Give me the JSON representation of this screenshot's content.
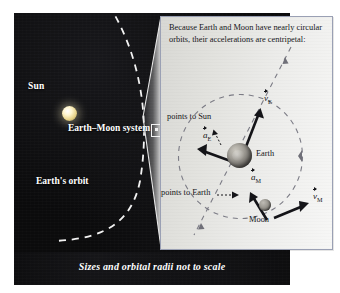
{
  "figure": {
    "caption": "Sizes and orbital radii not to scale"
  },
  "space_scene": {
    "sun_label": "Sun",
    "earth_moon_system_label": "Earth–Moon system",
    "earth_orbit_label": "Earth's orbit"
  },
  "inset": {
    "explanation": "Because Earth and Moon have nearly circular orbits, their accelerations are centripetal:",
    "earth_label": "Earth",
    "moon_label": "Moon",
    "points_to_sun_label": "points to Sun",
    "points_to_earth_label": "points to Earth",
    "vectors": {
      "v_earth": {
        "symbol": "v",
        "subscript": "E"
      },
      "a_earth": {
        "symbol": "a",
        "subscript": "E"
      },
      "v_moon": {
        "symbol": "v",
        "subscript": "M"
      },
      "a_moon": {
        "symbol": "a",
        "subscript": "M"
      }
    }
  },
  "colors": {
    "space_background": "#0b0b0c",
    "inset_background": "#e8e8e5",
    "inset_border": "#9aa0b4",
    "label_text": "#ffffff",
    "sun_glow": "#fff6cf",
    "vector_stroke": "#141418",
    "orbit_dash": "#ffffff"
  }
}
